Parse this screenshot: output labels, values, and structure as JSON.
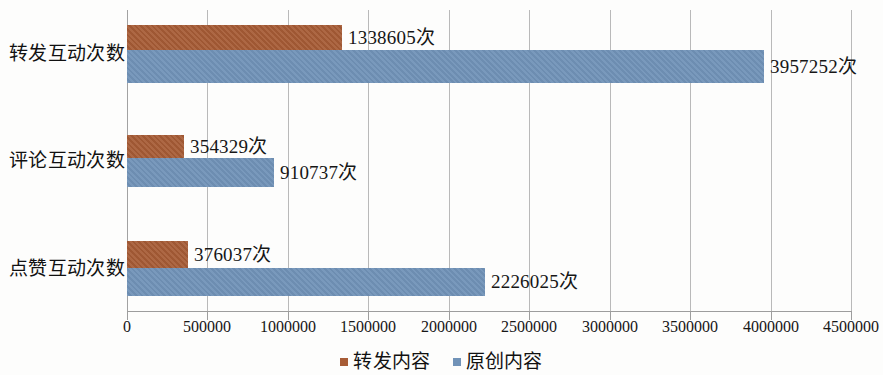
{
  "chart_data": {
    "type": "bar",
    "orientation": "horizontal",
    "title": "",
    "xlabel": "",
    "ylabel": "",
    "categories": [
      "转发互动次数",
      "评论互动次数",
      "点赞互动次数"
    ],
    "series": [
      {
        "name": "转发内容",
        "color": "#a75c36",
        "values": [
          1338605,
          354329,
          376037
        ],
        "labels": [
          "1338605次",
          "354329次",
          "376037次"
        ]
      },
      {
        "name": "原创内容",
        "color": "#7193b8",
        "values": [
          3957252,
          910737,
          2226025
        ],
        "labels": [
          "3957252次",
          "910737次",
          "2226025次"
        ]
      }
    ],
    "xlim": [
      0,
      4500000
    ],
    "xticks": [
      0,
      500000,
      1000000,
      1500000,
      2000000,
      2500000,
      3000000,
      3500000,
      4000000,
      4500000
    ],
    "xtick_labels": [
      "0",
      "500000",
      "1000000",
      "1500000",
      "2000000",
      "2500000",
      "3000000",
      "3500000",
      "4000000",
      "4500000"
    ],
    "grid": true,
    "grid_axis": "x",
    "legend_position": "bottom",
    "legend_entries": [
      "转发内容",
      "原创内容"
    ]
  }
}
